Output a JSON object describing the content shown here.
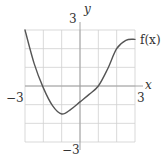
{
  "chart_data": {
    "type": "line",
    "title": "",
    "xlabel": "x",
    "ylabel": "y",
    "xlim": [
      -3,
      3
    ],
    "ylim": [
      -3,
      3
    ],
    "grid": true,
    "grid_step": 1,
    "tick_labels": {
      "x_min": "−3",
      "x_max": "3",
      "y_min": "−3",
      "y_max": "3"
    },
    "series": [
      {
        "name": "f(x)",
        "x": [
          -3,
          -2.5,
          -2,
          -1.5,
          -1,
          -0.5,
          0,
          0.5,
          1,
          1.5,
          2,
          2.5,
          3
        ],
        "y": [
          3,
          1.2,
          -0.1,
          -1.05,
          -1.5,
          -1.25,
          -0.85,
          -0.45,
          0.0,
          0.9,
          2.0,
          2.45,
          2.5
        ]
      }
    ],
    "annotations": [
      "f(x)"
    ],
    "colors": {
      "grid": "#cfcfcf",
      "axis": "#9a9a9a",
      "curve": "#555555",
      "text": "#333333"
    }
  }
}
